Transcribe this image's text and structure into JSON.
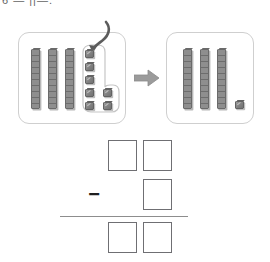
{
  "header": {
    "cropped_text": "6 —   ||—."
  },
  "manipulatives": {
    "before_panel": {
      "label": "before-regrouping",
      "rods": 3,
      "rod_unit_count": 10,
      "loose_cubes": 7,
      "grouped_cubes": 7,
      "total_value": 37,
      "lasso_label": "regrouping-group",
      "curved_arrow_label": "regroup-arrow"
    },
    "transform_arrow": {
      "icon": "arrow-right-icon"
    },
    "after_panel": {
      "label": "after-regrouping",
      "rods": 3,
      "rod_unit_count": 10,
      "loose_cubes": 1,
      "total_value": 31
    }
  },
  "problem": {
    "operator": "−",
    "minuend": {
      "tens": "",
      "ones": ""
    },
    "subtrahend": {
      "ones": ""
    },
    "difference": {
      "tens": "",
      "ones": ""
    },
    "boxes": {
      "minuend_tens_placeholder": "",
      "minuend_ones_placeholder": "",
      "subtrahend_ones_placeholder": "",
      "difference_tens_placeholder": "",
      "difference_ones_placeholder": ""
    }
  },
  "colors": {
    "panel_border": "#cfcfcf",
    "rod_fill": "#8e8e8e",
    "cube_fill": "#808080",
    "box_border": "#6f6f73",
    "bar": "#8d8d8d",
    "arrow": "#9b9b9b"
  }
}
